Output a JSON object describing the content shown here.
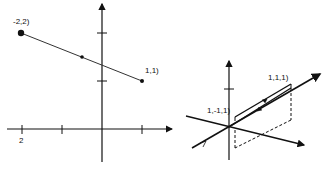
{
  "figure": {
    "left_plot": {
      "type": "2d-line-segment",
      "point_a_label": "-2,2)",
      "point_b_label": "1,1)",
      "x_tick_label": "2",
      "point_a": [
        -2,
        2
      ],
      "point_b": [
        1,
        1
      ]
    },
    "right_plot": {
      "type": "3d-vectors",
      "point_a_label": "1,-1,1)",
      "point_b_label": "1,1,1)",
      "point_a": [
        1,
        -1,
        1
      ],
      "point_b": [
        1,
        1,
        1
      ]
    },
    "colors": {
      "ink": "#111111",
      "line": "#333333",
      "background": "#ffffff"
    }
  }
}
